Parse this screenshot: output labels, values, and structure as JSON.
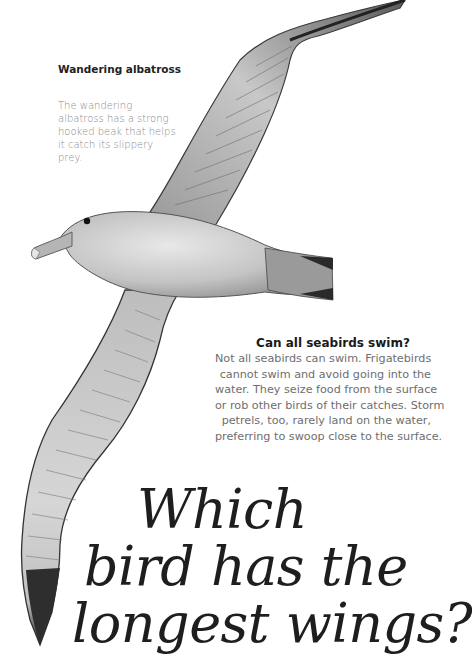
{
  "page": {
    "background": "#ffffff",
    "illustration": {
      "subject": "wandering albatross in flight",
      "icon": "albatross-illustration"
    },
    "caption": {
      "title": "Wandering albatross",
      "body": "The wandering albatross has a strong hooked beak that helps it catch its slippery prey."
    },
    "faq": {
      "title": "Can all seabirds swim?",
      "lines": [
        "Not all seabirds can swim. Frigatebirds",
        "cannot swim and avoid going into the",
        "water. They seize food from the surface",
        "or rob other birds of their catches. Storm",
        "petrels, too, rarely land on the water,",
        "preferring to swoop close to the surface."
      ]
    },
    "headline": {
      "lines": [
        "Which",
        "bird has the",
        "longest wings?"
      ]
    },
    "colors": {
      "title_text": "#222222",
      "body_text": "#8a8a8a",
      "faq_text": "#6e6e6e",
      "headline_text": "#1e1e1e"
    }
  }
}
